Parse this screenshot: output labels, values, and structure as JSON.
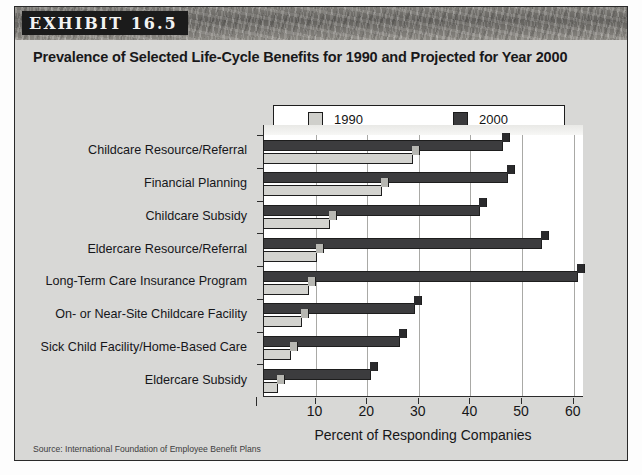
{
  "exhibit": {
    "tag": "EXHIBIT 16.5",
    "title": "Prevalence of Selected Life-Cycle Benefits for 1990 and Projected for Year 2000",
    "source": "Source: International Foundation of Employee Benefit Plans"
  },
  "legend": {
    "items": [
      {
        "label": "1990",
        "color": "#cfcfcb"
      },
      {
        "label": "2000",
        "color": "#3a3a3c"
      }
    ]
  },
  "chart_data": {
    "type": "bar",
    "orientation": "horizontal",
    "title": "Prevalence of Selected Life-Cycle Benefits for 1990 and Projected for Year 2000",
    "xlabel": "Percent of Responding Companies",
    "ylabel": "",
    "xlim": [
      0,
      62
    ],
    "xticks": [
      10,
      20,
      30,
      40,
      50,
      60
    ],
    "grid": true,
    "legend_position": "top",
    "categories": [
      "Childcare Resource/Referral",
      "Financial Planning",
      "Childcare Subsidy",
      "Eldercare Resource/Referral",
      "Long-Term Care Insurance Program",
      "On- or Near-Site Childcare Facility",
      "Sick Child Facility/Home-Based Care",
      "Eldercare Subsidy"
    ],
    "series": [
      {
        "name": "1990",
        "color": "#cfcfcb",
        "values": [
          29,
          23,
          13,
          10.5,
          9,
          7.5,
          5.5,
          3
        ]
      },
      {
        "name": "2000",
        "color": "#3a3a3c",
        "values": [
          46.5,
          47.5,
          42,
          54,
          61,
          29.5,
          26.5,
          21
        ]
      }
    ]
  },
  "axis": {
    "x_tick_labels": [
      "10",
      "20",
      "30",
      "40",
      "50",
      "60"
    ],
    "x_axis_title": "Percent of Responding Companies"
  }
}
